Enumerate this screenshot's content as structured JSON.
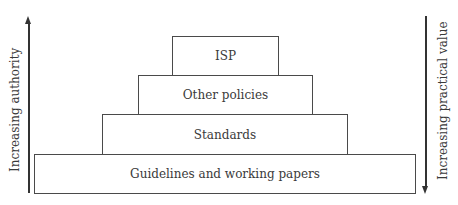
{
  "diagram": {
    "type": "stacked-pyramid",
    "levels": [
      {
        "label": "ISP"
      },
      {
        "label": "Other policies"
      },
      {
        "label": "Standards"
      },
      {
        "label": "Guidelines and working papers"
      }
    ],
    "left_axis": {
      "label": "Increasing authority",
      "direction": "up"
    },
    "right_axis": {
      "label": "Increasing practical value",
      "direction": "down"
    }
  }
}
